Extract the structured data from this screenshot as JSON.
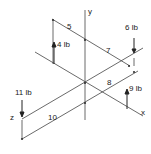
{
  "diagram": {
    "axes": {
      "x": "x",
      "y": "y",
      "z": "z"
    },
    "forces": [
      {
        "label": "4 lb",
        "direction": "up"
      },
      {
        "label": "6 lb",
        "direction": "down"
      },
      {
        "label": "9 lb",
        "direction": "up"
      },
      {
        "label": "11 lb",
        "direction": "down"
      }
    ],
    "dimensions": [
      "5",
      "7",
      "8",
      "10"
    ],
    "colors": {
      "line": "#333333",
      "background": "#ffffff"
    }
  }
}
